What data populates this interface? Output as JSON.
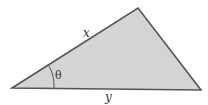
{
  "diagram": {
    "type": "triangle",
    "fill_color": "#d4d4d4",
    "stroke_color": "#555555",
    "labels": {
      "side_top": "x",
      "side_bottom": "y",
      "angle": "θ"
    }
  }
}
